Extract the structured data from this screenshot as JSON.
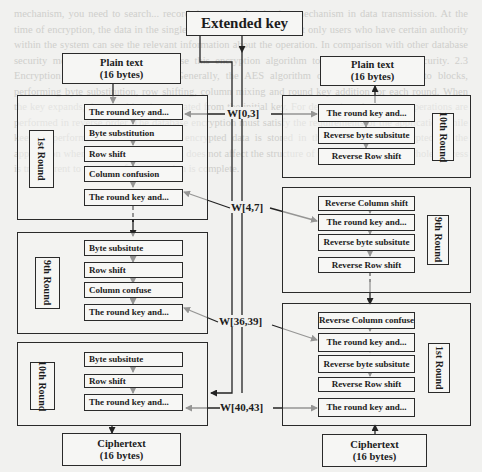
{
  "diagram": {
    "title": "Extended key",
    "encryption": {
      "input": {
        "line1": "Plain text",
        "line2": "(16 bytes)"
      },
      "rounds": [
        {
          "label": "1st Round",
          "steps": [
            "The round key and...",
            "Byte substitution",
            "Row shift",
            "Column confusion",
            "The round key and..."
          ]
        },
        {
          "label": "9th Round",
          "steps": [
            "Byte subsitute",
            "Row shift",
            "Column confuse",
            "The round key and..."
          ]
        },
        {
          "label": "10th Round",
          "steps": [
            "Byte subsitute",
            "Row shift",
            "The round key and..."
          ]
        }
      ],
      "output": {
        "line1": "Ciphertext",
        "line2": "(16 bytes)"
      }
    },
    "decryption": {
      "output": {
        "line1": "Plain text",
        "line2": "(16 bytes)"
      },
      "rounds": [
        {
          "label": "10th Round",
          "steps": [
            "The round key and...",
            "Reverse byte subsitute",
            "Reverse Row shift"
          ]
        },
        {
          "label": "9th Round",
          "steps": [
            "Reverse Column shift",
            "The round key and...",
            "Reverse byte subsitute",
            "Reverse Row shift"
          ]
        },
        {
          "label": "1st Round",
          "steps": [
            "Reverse Column confuse",
            "The round key and...",
            "Reverse byte subsitute",
            "Reverse Row shift",
            "The round key and..."
          ]
        }
      ],
      "input": {
        "line1": "Ciphertext",
        "line2": "(16 bytes)"
      }
    },
    "key_labels": [
      "W[0,3]",
      "W[4,7]",
      "W[36,39]",
      "W[40,43]"
    ]
  },
  "background_text": "mechanism, you need to search... record the user authentication mechanism in data transmission. At the time of encryption, the data in the single record is encrypted, so that only users who have certain authority within the system can see the relevant information about the operation. In comparison with other database security mechanisms and methods, use this encryption algorithm to ensure information security. 2.3 Encryption Algorithm Comparison. Generally, the AES algorithm divides the plaintext into blocks, performing byte substitution, row shifting, column mixing and round key addition for each round. When the key expands, the round key is generated from the initial key. For decryption, the inverse operations are performed in reverse order. The database encryption must satisfy the requirements of the application while keeping performance acceptable. The encrypted data is stored in the database and decrypted by the application when it is read. This method does not affect the structure of the database, and the whole process is transparent to the user after encryption is complete."
}
